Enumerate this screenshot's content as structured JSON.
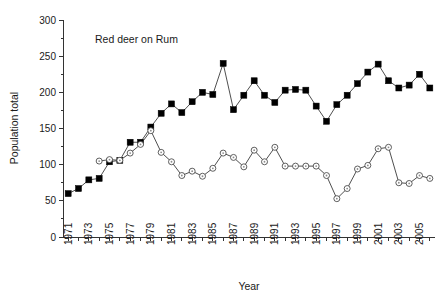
{
  "chart_data": {
    "type": "line",
    "title": "Red deer on Rum",
    "xlabel": "Year",
    "ylabel": "Population total",
    "xlim": [
      1970.5,
      2006.5
    ],
    "ylim": [
      0,
      300
    ],
    "y_ticks": [
      0,
      50,
      100,
      150,
      200,
      250,
      300
    ],
    "y_tick_labels": [
      "0",
      "50",
      "100",
      "150",
      "200",
      "250",
      "300"
    ],
    "x_ticks": [
      1971,
      1972,
      1973,
      1974,
      1975,
      1976,
      1977,
      1978,
      1979,
      1980,
      1981,
      1982,
      1983,
      1984,
      1985,
      1986,
      1987,
      1988,
      1989,
      1990,
      1991,
      1992,
      1993,
      1994,
      1995,
      1996,
      1997,
      1998,
      1999,
      2000,
      2001,
      2002,
      2003,
      2004,
      2005,
      2006
    ],
    "x_tick_labels": [
      "1971",
      "",
      "1973",
      "",
      "1975",
      "",
      "1977",
      "",
      "1979",
      "",
      "1981",
      "",
      "1983",
      "",
      "1985",
      "",
      "1987",
      "",
      "1989",
      "",
      "1991",
      "",
      "1993",
      "",
      "1995",
      "",
      "1997",
      "",
      "1999",
      "",
      "2001",
      "",
      "2003",
      "",
      "2005",
      ""
    ],
    "grid": false,
    "legend": "none",
    "series": [
      {
        "name": "Population total",
        "marker": "filled-square",
        "color": "#000000",
        "x": [
          1971,
          1972,
          1973,
          1974,
          1975,
          1976,
          1977,
          1978,
          1979,
          1980,
          1981,
          1982,
          1983,
          1984,
          1985,
          1986,
          1987,
          1988,
          1989,
          1990,
          1991,
          1992,
          1993,
          1994,
          1995,
          1996,
          1997,
          1998,
          1999,
          2000,
          2001,
          2002,
          2003,
          2004,
          2005,
          2006
        ],
        "values": [
          60,
          67,
          79,
          81,
          104,
          106,
          131,
          131,
          152,
          171,
          184,
          172,
          187,
          200,
          197,
          240,
          176,
          196,
          216,
          196,
          186,
          203,
          204,
          203,
          181,
          160,
          183,
          196,
          212,
          228,
          239,
          216,
          206,
          210,
          225,
          206
        ]
      },
      {
        "name": "Females",
        "marker": "open-circle",
        "color": "#4d4d4d",
        "x": [
          1974,
          1975,
          1976,
          1977,
          1978,
          1979,
          1980,
          1981,
          1982,
          1983,
          1984,
          1985,
          1986,
          1987,
          1988,
          1989,
          1990,
          1991,
          1992,
          1993,
          1994,
          1995,
          1996,
          1997,
          1998,
          1999,
          2000,
          2001,
          2002,
          2003,
          2004,
          2005,
          2006
        ],
        "values": [
          105,
          107,
          106,
          116,
          128,
          147,
          117,
          104,
          85,
          91,
          84,
          95,
          116,
          110,
          97,
          120,
          104,
          124,
          98,
          98,
          98,
          98,
          85,
          53,
          67,
          94,
          99,
          122,
          124,
          75,
          74,
          85,
          81
        ]
      }
    ]
  }
}
